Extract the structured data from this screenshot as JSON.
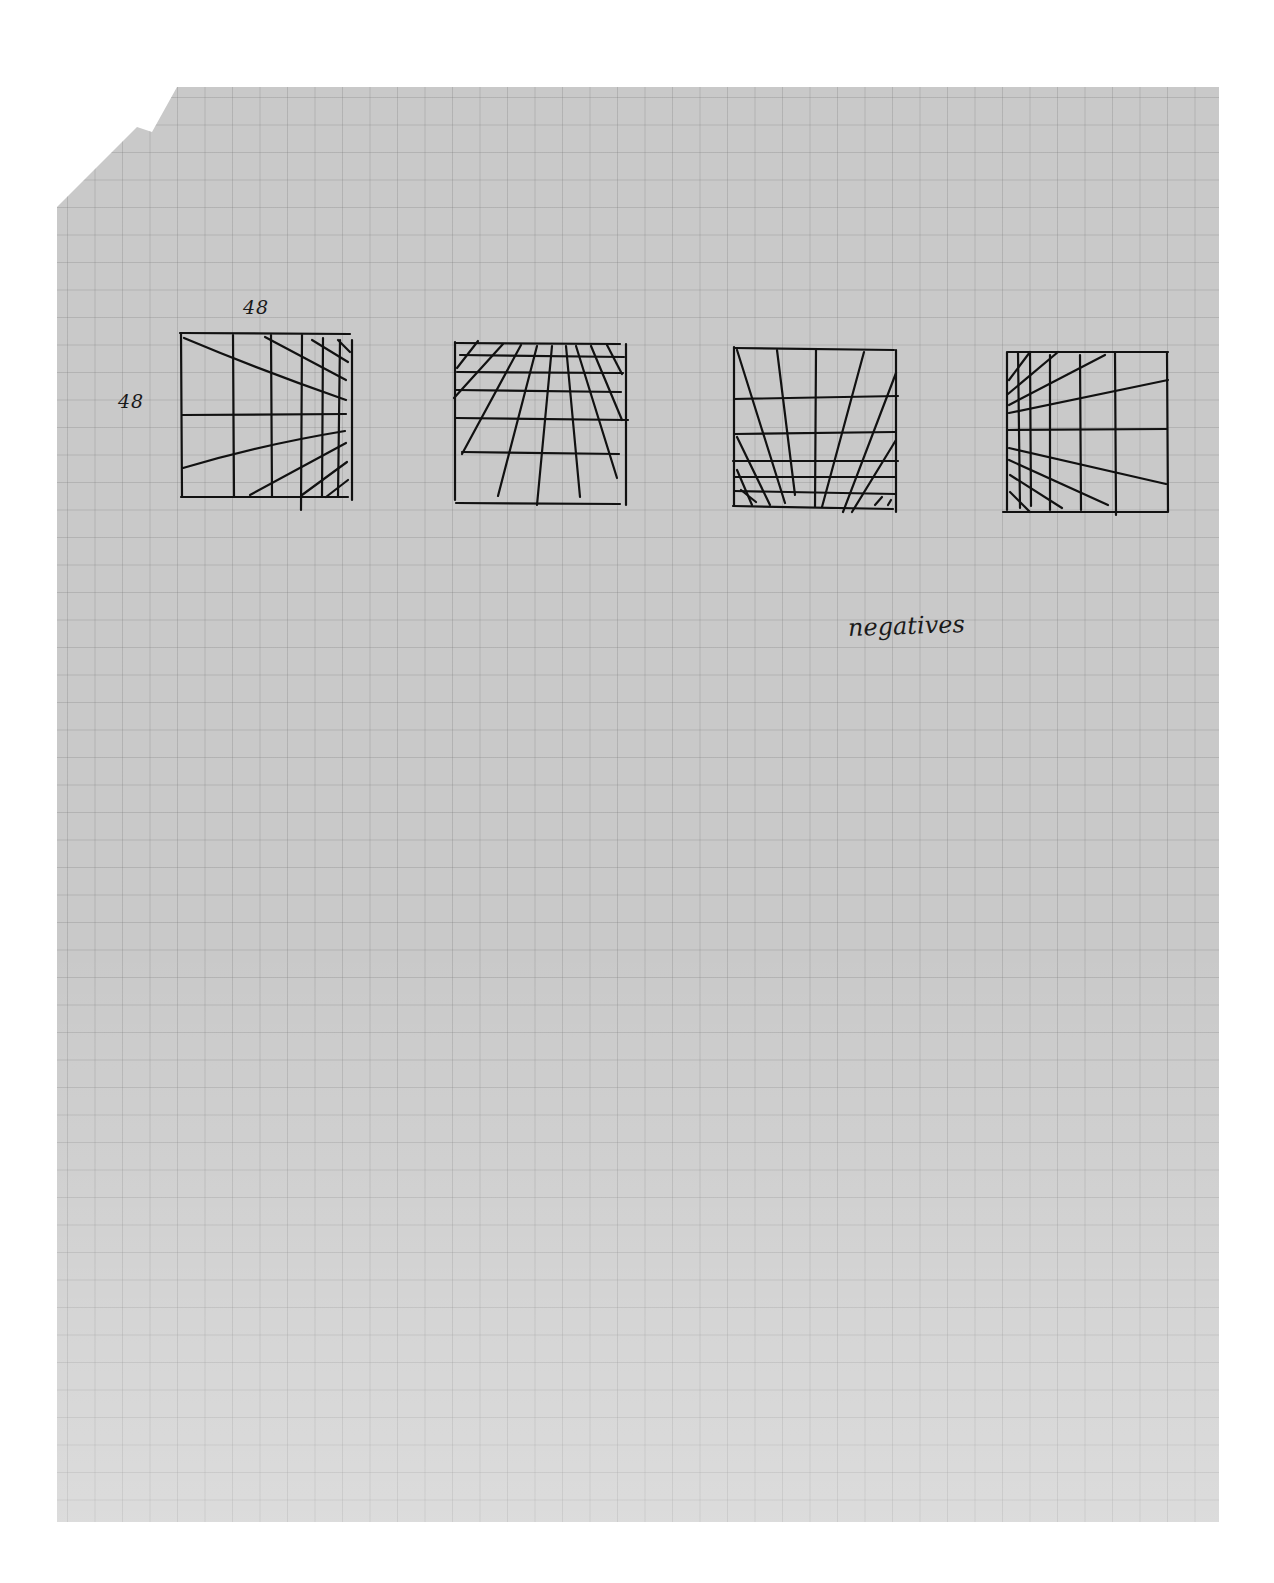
{
  "document": {
    "type": "graph paper sketch page",
    "labels": {
      "width_label": "48",
      "height_label": "48",
      "caption": "negatives"
    },
    "sketches": [
      {
        "id": 1,
        "description": "square grid with lines converging to the right edge"
      },
      {
        "id": 2,
        "description": "square grid with lines converging toward the top edge"
      },
      {
        "id": 3,
        "description": "square grid with lines converging toward the bottom edge"
      },
      {
        "id": 4,
        "description": "square grid with lines converging to the left edge"
      }
    ],
    "colors": {
      "paper": "#c9c9c9",
      "grid": "#8a8a8a",
      "ink": "#111111",
      "background": "#ffffff"
    }
  }
}
